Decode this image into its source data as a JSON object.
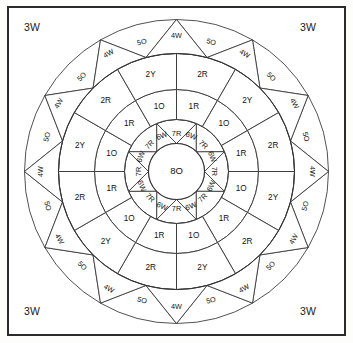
{
  "diagram": {
    "center": {
      "label": "8O",
      "cx": 176.5,
      "cy": 171.5,
      "radius": 28
    },
    "corner_labels": {
      "top_left": "3W",
      "top_right": "3W",
      "bottom_left": "3W",
      "bottom_right": "3W"
    },
    "colors": {
      "stroke": "#333333",
      "fill": "#ffffff",
      "text": "#111111",
      "frame": "#2b2b2b",
      "page_background": "#fdfdfb"
    },
    "rings": [
      {
        "name": "inner-triangle-ring",
        "type": "triangles",
        "inner_radius": 28,
        "outer_radius": 52,
        "segments": 8,
        "rotation_deg": -90,
        "outward_label": "6W",
        "inward_label": "7R",
        "labels": [
          "6W",
          "7R",
          "6W",
          "7R",
          "6W",
          "7R",
          "6W",
          "7R",
          "6W",
          "7R",
          "6W",
          "7R",
          "6W",
          "7R",
          "6W",
          "7R"
        ]
      },
      {
        "name": "ring-1",
        "type": "sectors",
        "inner_radius": 52,
        "outer_radius": 82,
        "segments": 12,
        "rotation_deg": -90,
        "labels": [
          "1R",
          "1O",
          "1R",
          "1O",
          "1R",
          "1O",
          "1R",
          "1O",
          "1R",
          "1O",
          "1R",
          "1O"
        ]
      },
      {
        "name": "ring-2",
        "type": "sectors",
        "inner_radius": 82,
        "outer_radius": 118,
        "segments": 12,
        "rotation_deg": -90,
        "labels": [
          "2R",
          "2Y",
          "2R",
          "2Y",
          "2R",
          "2Y",
          "2R",
          "2Y",
          "2R",
          "2Y",
          "2R",
          "2Y"
        ]
      },
      {
        "name": "ring-3-sawtooth",
        "type": "sawtooth",
        "inner_radius": 118,
        "outer_radius": 152,
        "segments": 24,
        "rotation_deg": -90,
        "outward_label": "4W",
        "inward_label": "5O",
        "labels": [
          "4W",
          "5O",
          "4W",
          "5O",
          "4W",
          "5O",
          "4W",
          "5O",
          "4W",
          "5O",
          "4W",
          "5O",
          "4W",
          "5O",
          "4W",
          "5O",
          "4W",
          "5O",
          "4W",
          "5O",
          "4W",
          "5O",
          "4W",
          "5O",
          "4W",
          "5O",
          "4W",
          "5O",
          "4W",
          "5O",
          "4W",
          "5O",
          "4W",
          "5O",
          "4W",
          "5O",
          "4W",
          "5O",
          "4W",
          "5O",
          "4W",
          "5O",
          "4W",
          "5O",
          "4W",
          "5O",
          "4W",
          "5O"
        ]
      }
    ]
  }
}
